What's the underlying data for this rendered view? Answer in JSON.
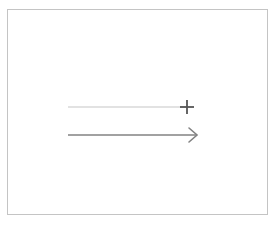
{
  "window": {
    "clipped_top_text": "—  ·  ——  ———  ··  ——  —"
  },
  "canvas": {
    "label": "Drawing canvas",
    "background_color": "#ffffff",
    "border_color": "#c4c4c4",
    "x": 7,
    "y": 9,
    "width": 261,
    "height": 206
  },
  "shapes": [
    {
      "id": "guide-line",
      "name": "light-guide-line",
      "type": "line",
      "color": "#d8d8d8",
      "stroke_width": 1.4,
      "x1": 60,
      "y1": 97,
      "x2": 179,
      "y2": 97
    },
    {
      "id": "crosshair",
      "name": "crosshair-cursor",
      "type": "crosshair",
      "color": "#555555",
      "stroke_width": 1.8,
      "cx": 179,
      "cy": 97,
      "arm_length": 7
    },
    {
      "id": "arrow-connector",
      "name": "arrow-connector",
      "type": "arrow",
      "color": "#828282",
      "stroke_width": 1.6,
      "x1": 60,
      "y1": 125,
      "x2": 188,
      "y2": 125,
      "arrowhead": "open-chevron",
      "arrowhead_size": 7
    }
  ]
}
